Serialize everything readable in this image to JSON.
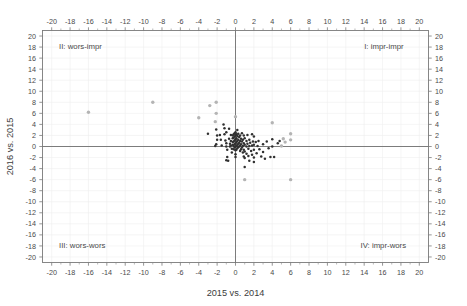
{
  "chart_data": {
    "type": "scatter",
    "title": "",
    "xlabel": "2015 vs. 2014",
    "ylabel": "2016 vs. 2015",
    "xlim": [
      -21,
      21
    ],
    "ylim": [
      -21,
      21
    ],
    "grid": true,
    "legend": null,
    "xticks": [
      -20,
      -18,
      -16,
      -14,
      -12,
      -10,
      -8,
      -6,
      -4,
      -2,
      0,
      2,
      4,
      6,
      8,
      10,
      12,
      14,
      16,
      18,
      20
    ],
    "yticks": [
      -20,
      -18,
      -16,
      -14,
      -12,
      -10,
      -8,
      -6,
      -4,
      -2,
      0,
      2,
      4,
      6,
      8,
      10,
      12,
      14,
      16,
      18,
      20
    ],
    "xtick_labels": [
      "-20",
      "-18",
      "-16",
      "-14",
      "-12",
      "-10",
      "-8",
      "-6",
      "-4",
      "-2",
      "0",
      "2",
      "4",
      "6",
      "8",
      "10",
      "12",
      "14",
      "16",
      "18",
      "20"
    ],
    "ytick_labels": [
      "-20",
      "-18",
      "-16",
      "-14",
      "-12",
      "-10",
      "-8",
      "-6",
      "-4",
      "-2",
      "0",
      "2",
      "4",
      "6",
      "8",
      "10",
      "12",
      "14",
      "16",
      "18",
      "20"
    ],
    "axes_on_all_sides": true,
    "annotations": [
      {
        "id": "quadrant-2",
        "text": "II: wors-impr",
        "x": -19.2,
        "y": 18.1
      },
      {
        "id": "quadrant-1",
        "text": "I: impr-impr",
        "x": 14.0,
        "y": 18.1
      },
      {
        "id": "quadrant-3",
        "text": "III: wors-wors",
        "x": -19.2,
        "y": -17.9
      },
      {
        "id": "quadrant-4",
        "text": "IV: impr-wors",
        "x": 13.6,
        "y": -17.9
      }
    ],
    "points": [
      [
        -16.0,
        6.2
      ],
      [
        -9.0,
        8.0
      ],
      [
        -4.0,
        5.2
      ],
      [
        -2.8,
        7.4
      ],
      [
        -2.1,
        8.0
      ],
      [
        -2.1,
        6.0
      ],
      [
        -2.2,
        4.5
      ],
      [
        -3.0,
        2.3
      ],
      [
        -2.1,
        3.1
      ],
      [
        -2.0,
        2.0
      ],
      [
        -2.0,
        1.2
      ],
      [
        -2.1,
        0.4
      ],
      [
        -2.2,
        0.1
      ],
      [
        -1.7,
        2.1
      ],
      [
        -1.6,
        1.2
      ],
      [
        -1.5,
        0.2
      ],
      [
        -1.3,
        4.0
      ],
      [
        -1.2,
        3.3
      ],
      [
        -1.2,
        2.2
      ],
      [
        -1.1,
        1.1
      ],
      [
        -1.0,
        2.6
      ],
      [
        -1.0,
        0.6
      ],
      [
        -1.0,
        0.0
      ],
      [
        -0.9,
        -0.6
      ],
      [
        -0.9,
        -1.9
      ],
      [
        -1.0,
        -2.5
      ],
      [
        -0.8,
        -2.6
      ],
      [
        -0.7,
        3.2
      ],
      [
        -0.7,
        1.4
      ],
      [
        -0.6,
        0.5
      ],
      [
        -0.6,
        0.0
      ],
      [
        -0.5,
        2.1
      ],
      [
        -0.5,
        1.0
      ],
      [
        -0.5,
        0.2
      ],
      [
        -0.4,
        -0.4
      ],
      [
        -0.4,
        -1.1
      ],
      [
        -0.3,
        2.0
      ],
      [
        -0.3,
        1.5
      ],
      [
        -0.3,
        0.8
      ],
      [
        -0.3,
        0.3
      ],
      [
        -0.2,
        2.2
      ],
      [
        -0.2,
        1.6
      ],
      [
        -0.2,
        0.9
      ],
      [
        -0.2,
        0.1
      ],
      [
        -0.2,
        -0.5
      ],
      [
        -0.1,
        2.4
      ],
      [
        -0.1,
        1.8
      ],
      [
        -0.1,
        1.1
      ],
      [
        -0.1,
        0.4
      ],
      [
        -0.1,
        -0.2
      ],
      [
        0.0,
        5.4
      ],
      [
        0.0,
        2.6
      ],
      [
        0.0,
        2.0
      ],
      [
        0.0,
        1.3
      ],
      [
        0.0,
        0.6
      ],
      [
        0.0,
        0.0
      ],
      [
        0.0,
        -0.7
      ],
      [
        0.0,
        -1.4
      ],
      [
        0.0,
        -1.9
      ],
      [
        0.1,
        2.2
      ],
      [
        0.1,
        1.5
      ],
      [
        0.1,
        0.8
      ],
      [
        0.1,
        0.1
      ],
      [
        0.1,
        -0.6
      ],
      [
        0.2,
        3.0
      ],
      [
        0.2,
        1.9
      ],
      [
        0.2,
        1.0
      ],
      [
        0.2,
        0.3
      ],
      [
        0.2,
        -0.3
      ],
      [
        0.3,
        2.3
      ],
      [
        0.3,
        1.2
      ],
      [
        0.3,
        0.5
      ],
      [
        0.3,
        -0.1
      ],
      [
        0.4,
        1.7
      ],
      [
        0.4,
        0.7
      ],
      [
        0.4,
        0.0
      ],
      [
        0.5,
        2.0
      ],
      [
        0.5,
        1.0
      ],
      [
        0.5,
        0.2
      ],
      [
        0.5,
        -0.8
      ],
      [
        0.6,
        1.4
      ],
      [
        0.6,
        0.4
      ],
      [
        0.6,
        -0.5
      ],
      [
        0.7,
        2.4
      ],
      [
        0.7,
        0.9
      ],
      [
        0.7,
        -0.2
      ],
      [
        0.8,
        1.2
      ],
      [
        0.8,
        0.1
      ],
      [
        0.8,
        -1.1
      ],
      [
        0.9,
        2.0
      ],
      [
        0.9,
        0.6
      ],
      [
        0.9,
        -0.6
      ],
      [
        0.9,
        -1.8
      ],
      [
        1.0,
        1.5
      ],
      [
        1.0,
        0.3
      ],
      [
        1.0,
        -0.9
      ],
      [
        1.0,
        -2.1
      ],
      [
        1.0,
        -3.7
      ],
      [
        1.0,
        -6.0
      ],
      [
        1.2,
        1.0
      ],
      [
        1.2,
        0.0
      ],
      [
        1.2,
        -1.3
      ],
      [
        1.3,
        2.1
      ],
      [
        1.3,
        0.5
      ],
      [
        1.4,
        -0.4
      ],
      [
        1.4,
        -1.7
      ],
      [
        1.5,
        1.2
      ],
      [
        1.5,
        0.1
      ],
      [
        1.5,
        -2.6
      ],
      [
        1.6,
        0.7
      ],
      [
        1.7,
        -0.8
      ],
      [
        1.8,
        2.2
      ],
      [
        1.8,
        0.2
      ],
      [
        1.8,
        -1.5
      ],
      [
        1.9,
        0.9
      ],
      [
        2.0,
        1.8
      ],
      [
        2.0,
        0.3
      ],
      [
        2.0,
        -0.6
      ],
      [
        2.0,
        -2.0
      ],
      [
        2.0,
        -2.8
      ],
      [
        2.2,
        0.8
      ],
      [
        2.3,
        -1.2
      ],
      [
        2.4,
        0.1
      ],
      [
        2.5,
        1.0
      ],
      [
        2.6,
        -0.5
      ],
      [
        2.8,
        -1.8
      ],
      [
        3.0,
        0.4
      ],
      [
        3.0,
        -1.0
      ],
      [
        3.2,
        -2.2
      ],
      [
        3.4,
        0.9
      ],
      [
        3.6,
        -0.3
      ],
      [
        3.8,
        -1.9
      ],
      [
        4.0,
        4.3
      ],
      [
        4.0,
        1.3
      ],
      [
        4.0,
        0.0
      ],
      [
        4.2,
        -1.9
      ],
      [
        4.6,
        0.6
      ],
      [
        4.8,
        1.0
      ],
      [
        5.0,
        0.1
      ],
      [
        5.2,
        1.4
      ],
      [
        5.4,
        0.8
      ],
      [
        6.0,
        2.3
      ],
      [
        6.0,
        1.2
      ],
      [
        6.0,
        -6.0
      ]
    ]
  }
}
